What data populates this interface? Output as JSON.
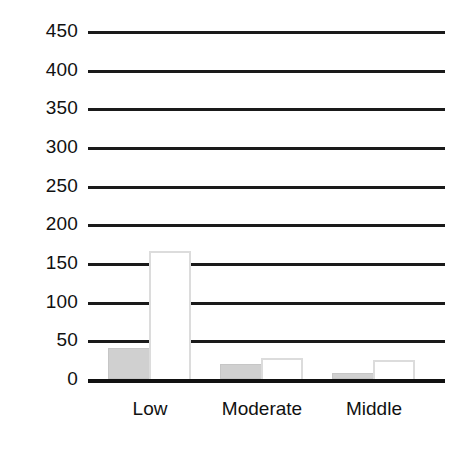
{
  "chart_data": {
    "type": "bar",
    "title": "",
    "subtitle": "",
    "xlabel": "",
    "ylabel": "",
    "categories": [
      "Low",
      "Moderate",
      "Middle"
    ],
    "series": [
      {
        "name": "gray-series",
        "values": [
          40,
          20,
          8
        ],
        "color": "#d0d0d0",
        "style": "filled"
      },
      {
        "name": "white-series",
        "values": [
          165,
          27,
          24
        ],
        "color": "#ffffff",
        "style": "open-outline"
      }
    ],
    "ylim": [
      0,
      450
    ],
    "ytick_values": [
      0,
      50,
      100,
      150,
      200,
      250,
      300,
      350,
      400,
      450
    ],
    "ytick_labels": [
      "0",
      "50",
      "100",
      "150",
      "200",
      "250",
      "300",
      "350",
      "400",
      "450"
    ],
    "ytick_step": 50,
    "grid": "horizontal-only",
    "grid_color": "#1a1a1a",
    "legend": "none",
    "legend_position": "none",
    "axis_line_color": "#111111",
    "background": "#ffffff",
    "annotations": []
  },
  "axes": {
    "y_ticks": [
      {
        "label": "450",
        "value": 450
      },
      {
        "label": "400",
        "value": 400
      },
      {
        "label": "350",
        "value": 350
      },
      {
        "label": "300",
        "value": 300
      },
      {
        "label": "250",
        "value": 250
      },
      {
        "label": "200",
        "value": 200
      },
      {
        "label": "150",
        "value": 150
      },
      {
        "label": "100",
        "value": 100
      },
      {
        "label": "50",
        "value": 50
      },
      {
        "label": "0",
        "value": 0
      }
    ],
    "x_categories": [
      {
        "label": "Low"
      },
      {
        "label": "Moderate"
      },
      {
        "label": "Middle"
      }
    ]
  },
  "groups": [
    {
      "name": "Low",
      "bars": [
        {
          "series": "gray-series",
          "value": 40
        },
        {
          "series": "white-series",
          "value": 165
        }
      ]
    },
    {
      "name": "Moderate",
      "bars": [
        {
          "series": "gray-series",
          "value": 20
        },
        {
          "series": "white-series",
          "value": 27
        }
      ]
    },
    {
      "name": "Middle",
      "bars": [
        {
          "series": "gray-series",
          "value": 8
        },
        {
          "series": "white-series",
          "value": 24
        }
      ]
    }
  ]
}
